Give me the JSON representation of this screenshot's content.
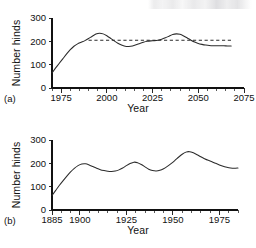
{
  "figure": {
    "background": "#ffffff",
    "line_color": "#2b2b2b",
    "text_color": "#111111",
    "artifact_note": "faint-scanned-text-smudge-top-right"
  },
  "chart_data": [
    {
      "id": "panel-a",
      "type": "line",
      "panel_label": "(a)",
      "title": "",
      "xlabel": "Year",
      "ylabel": "Number hinds",
      "xlim": [
        1970,
        2075
      ],
      "ylim": [
        0,
        300
      ],
      "yticks": [
        0,
        100,
        200,
        300
      ],
      "ytick_labels": [
        "0",
        "100",
        "200",
        "300"
      ],
      "xticks": [
        1975,
        2000,
        2025,
        2050,
        2075
      ],
      "xtick_labels": [
        "1975",
        "2000",
        "2025",
        "2050",
        "2075"
      ],
      "x_minor_interval": 5,
      "grid": false,
      "legend": "none",
      "series": [
        {
          "name": "Projected hinds",
          "style": "solid",
          "x": [
            1970,
            1972,
            1974,
            1976,
            1978,
            1980,
            1982,
            1984,
            1986,
            1988,
            1990,
            1992,
            1994,
            1996,
            1998,
            2000,
            2002,
            2004,
            2006,
            2008,
            2010,
            2012,
            2014,
            2016,
            2018,
            2020,
            2022,
            2024,
            2026,
            2028,
            2030,
            2032,
            2034,
            2036,
            2038,
            2040,
            2042,
            2044,
            2046,
            2048,
            2050,
            2052,
            2054,
            2056,
            2058,
            2060,
            2062,
            2064,
            2066,
            2068
          ],
          "y": [
            65,
            86,
            106,
            126,
            146,
            164,
            179,
            189,
            196,
            203,
            212,
            222,
            231,
            235,
            232,
            224,
            213,
            202,
            192,
            184,
            179,
            178,
            180,
            185,
            191,
            196,
            200,
            202,
            203,
            205,
            209,
            215,
            222,
            229,
            232,
            230,
            223,
            214,
            205,
            197,
            191,
            187,
            184,
            182,
            181,
            181,
            181,
            181,
            180,
            180
          ]
        },
        {
          "name": "Reference level",
          "style": "dashed",
          "x": [
            1990,
            2068
          ],
          "y": [
            205,
            205
          ]
        }
      ]
    },
    {
      "id": "panel-b",
      "type": "line",
      "panel_label": "(b)",
      "title": "",
      "xlabel": "Year",
      "ylabel": "Number hinds",
      "xlim": [
        1885,
        1985
      ],
      "ylim": [
        0,
        300
      ],
      "yticks": [
        0,
        100,
        200,
        300
      ],
      "ytick_labels": [
        "0",
        "100",
        "200",
        "300"
      ],
      "xticks": [
        1885,
        1900,
        1925,
        1950,
        1975
      ],
      "xtick_labels": [
        "1885",
        "1900",
        "1925",
        "1950",
        "1975"
      ],
      "x_minor_interval": 5,
      "grid": false,
      "legend": "none",
      "series": [
        {
          "name": "Observed hinds",
          "style": "solid",
          "x": [
            1885,
            1887,
            1889,
            1891,
            1893,
            1895,
            1897,
            1899,
            1901,
            1903,
            1905,
            1907,
            1909,
            1911,
            1913,
            1915,
            1917,
            1919,
            1921,
            1923,
            1925,
            1927,
            1929,
            1931,
            1933,
            1935,
            1937,
            1939,
            1941,
            1943,
            1945,
            1947,
            1949,
            1951,
            1953,
            1955,
            1957,
            1959,
            1961,
            1963,
            1965,
            1967,
            1969,
            1971,
            1973,
            1975,
            1977,
            1979,
            1981,
            1983,
            1985
          ],
          "y": [
            62,
            84,
            106,
            126,
            145,
            163,
            178,
            190,
            197,
            198,
            193,
            186,
            179,
            173,
            169,
            166,
            165,
            167,
            172,
            180,
            190,
            199,
            205,
            203,
            195,
            185,
            175,
            169,
            167,
            170,
            177,
            187,
            199,
            212,
            226,
            239,
            248,
            250,
            245,
            237,
            228,
            220,
            213,
            207,
            200,
            193,
            187,
            183,
            180,
            179,
            180
          ]
        }
      ]
    }
  ]
}
